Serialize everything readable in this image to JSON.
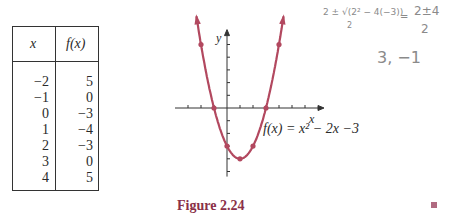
{
  "table": {
    "headers": [
      "x",
      "f(x)"
    ],
    "rows": [
      {
        "x": "−2",
        "fx": "5"
      },
      {
        "x": "−1",
        "fx": "0"
      },
      {
        "x": "0",
        "fx": "−3"
      },
      {
        "x": "1",
        "fx": "−4"
      },
      {
        "x": "2",
        "fx": "−3"
      },
      {
        "x": "3",
        "fx": "0"
      },
      {
        "x": "4",
        "fx": "5"
      }
    ]
  },
  "graph": {
    "x_label": "x",
    "y_label": "y",
    "equation": "f(x) = x² − 2x −3",
    "curve_color": "#b2485f"
  },
  "caption": "Figure 2.24",
  "handwriting": {
    "formula_left": "2 ± √(2² − 4(−3))",
    "formula_left_den": "2",
    "equals": "=",
    "formula_right_num": "2±4",
    "formula_right_den": "2",
    "roots": "3, −1"
  },
  "chart_data": {
    "type": "line",
    "title": "Figure 2.24",
    "function": "f(x) = x^2 - 2x - 3",
    "xlabel": "x",
    "ylabel": "y",
    "x": [
      -2,
      -1,
      0,
      1,
      2,
      3,
      4
    ],
    "values": [
      5,
      0,
      -3,
      -4,
      -3,
      0,
      5
    ],
    "xlim": [
      -4,
      7
    ],
    "ylim": [
      -5,
      6
    ],
    "grid": false,
    "legend": "none",
    "table": {
      "columns": [
        "x",
        "f(x)"
      ],
      "rows": [
        [
          -2,
          5
        ],
        [
          -1,
          0
        ],
        [
          0,
          -3
        ],
        [
          1,
          -4
        ],
        [
          2,
          -3
        ],
        [
          3,
          0
        ],
        [
          4,
          5
        ]
      ]
    }
  }
}
